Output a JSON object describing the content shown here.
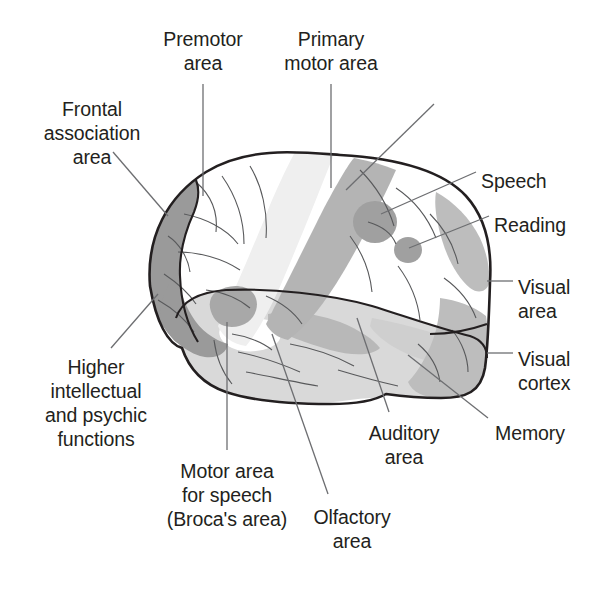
{
  "figure": {
    "type": "anatomical-diagram",
    "background_color": "#ffffff",
    "text_color": "#231f20",
    "leader_line_color": "#6d6e71",
    "outline_color": "#231f20"
  },
  "palette": {
    "white": "#ffffff",
    "very_light_gray": "#f0f0f0",
    "light_gray": "#dcdcdc",
    "mid_gray": "#c9c9c9",
    "gray": "#b4b4b4",
    "dark_gray": "#9a9a9a",
    "darker_gray": "#8c8c8c"
  },
  "labels": [
    {
      "id": "premotor-area",
      "lines": [
        "Premotor",
        "area"
      ],
      "x": 203,
      "y": 27,
      "align": "center"
    },
    {
      "id": "primary-motor-area",
      "lines": [
        "Primary",
        "motor area"
      ],
      "x": 331,
      "y": 27,
      "align": "center"
    },
    {
      "id": "frontal-association",
      "lines": [
        "Frontal",
        "association",
        "area"
      ],
      "x": 92,
      "y": 97,
      "align": "center"
    },
    {
      "id": "somatic-sensory-area",
      "lines": [
        "Somatic",
        "sensory area"
      ],
      "x": 443,
      "y": 97,
      "align": "left"
    },
    {
      "id": "speech",
      "lines": [
        "Speech"
      ],
      "x": 481,
      "y": 169,
      "align": "left"
    },
    {
      "id": "reading",
      "lines": [
        "Reading"
      ],
      "x": 494,
      "y": 213,
      "align": "left"
    },
    {
      "id": "visual-area",
      "lines": [
        "Visual",
        "area"
      ],
      "x": 518,
      "y": 275,
      "align": "left"
    },
    {
      "id": "visual-cortex",
      "lines": [
        "Visual",
        "cortex"
      ],
      "x": 518,
      "y": 347,
      "align": "left"
    },
    {
      "id": "memory",
      "lines": [
        "Memory"
      ],
      "x": 495,
      "y": 421,
      "align": "left"
    },
    {
      "id": "higher-intellectual",
      "lines": [
        "Higher",
        "intellectual",
        "and psychic",
        "functions"
      ],
      "x": 96,
      "y": 355,
      "align": "center"
    },
    {
      "id": "motor-area-speech",
      "lines": [
        "Motor area",
        "for speech",
        "(Broca's area)"
      ],
      "x": 227,
      "y": 459,
      "align": "center"
    },
    {
      "id": "olfactory-area",
      "lines": [
        "Olfactory",
        "area"
      ],
      "x": 352,
      "y": 505,
      "align": "center"
    },
    {
      "id": "auditory-area",
      "lines": [
        "Auditory",
        "area"
      ],
      "x": 404,
      "y": 421,
      "align": "center"
    }
  ],
  "leader_lines": [
    {
      "id": "leader-premotor",
      "points": "203,84 203,196"
    },
    {
      "id": "leader-primary-motor",
      "points": "331,84 331,188"
    },
    {
      "id": "leader-frontal-association",
      "points": "113,152 168,216"
    },
    {
      "id": "leader-somatic-sensory",
      "points": "434,104 346,190"
    },
    {
      "id": "leader-speech",
      "points": "476,172 381,214"
    },
    {
      "id": "leader-reading",
      "points": "489,216 409,248"
    },
    {
      "id": "leader-visual-area",
      "points": "513,281 487,281"
    },
    {
      "id": "leader-visual-cortex",
      "points": "513,353 487,353"
    },
    {
      "id": "leader-memory",
      "points": "488,418 408,355"
    },
    {
      "id": "leader-higher-intellectual",
      "points": "111,348 158,294"
    },
    {
      "id": "leader-motor-area-speech",
      "points": "227,450 227,322"
    },
    {
      "id": "leader-olfactory",
      "points": "328,494 272,334"
    },
    {
      "id": "leader-auditory",
      "points": "389,412 357,318"
    }
  ],
  "regions": [
    {
      "id": "frontal-association-region",
      "shade": "dark_gray",
      "note": "anterior frontal pole, dark gray"
    },
    {
      "id": "premotor-region",
      "shade": "white",
      "note": "white band anterior to precentral"
    },
    {
      "id": "primary-motor-region",
      "shade": "very_light_gray",
      "note": "pale precentral gyrus band"
    },
    {
      "id": "somatic-sensory-region",
      "shade": "gray",
      "note": "postcentral gyrus band, medium gray"
    },
    {
      "id": "speech-region",
      "shade": "dark_gray",
      "note": "upper circular patch"
    },
    {
      "id": "reading-region",
      "shade": "dark_gray",
      "note": "lower smaller circular patch"
    },
    {
      "id": "visual-area-region",
      "shade": "mid_gray",
      "note": "occipital pole upper"
    },
    {
      "id": "visual-cortex-region",
      "shade": "mid_gray",
      "note": "occipital pole lower"
    },
    {
      "id": "memory-region",
      "shade": "light_gray",
      "note": "posterior temporal"
    },
    {
      "id": "broca-region",
      "shade": "dark_gray",
      "note": "inferior frontal gyrus patch"
    },
    {
      "id": "auditory-region",
      "shade": "gray",
      "note": "superior temporal gyrus"
    },
    {
      "id": "olfactory-region",
      "shade": "white",
      "note": "temporal pole medial white patch"
    },
    {
      "id": "temporal-lobe",
      "shade": "light_gray",
      "note": "temporal lobe body"
    }
  ]
}
